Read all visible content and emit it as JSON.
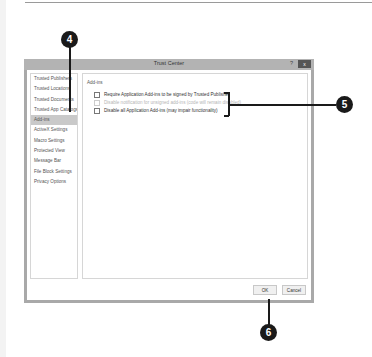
{
  "dialog": {
    "title": "Trust Center",
    "help_label": "?",
    "close_label": "x",
    "nav_items": [
      {
        "label": "Trusted Publishers",
        "selected": false
      },
      {
        "label": "Trusted Locations",
        "selected": false
      },
      {
        "label": "Trusted Documents",
        "selected": false
      },
      {
        "label": "Trusted App Catalogs",
        "selected": false
      },
      {
        "label": "Add-ins",
        "selected": true
      },
      {
        "label": "ActiveX Settings",
        "selected": false
      },
      {
        "label": "Macro Settings",
        "selected": false
      },
      {
        "label": "Protected View",
        "selected": false
      },
      {
        "label": "Message Bar",
        "selected": false
      },
      {
        "label": "File Block Settings",
        "selected": false
      },
      {
        "label": "Privacy Options",
        "selected": false
      }
    ],
    "pane": {
      "heading": "Add-ins",
      "options": [
        {
          "label": "Require Application Add-ins to be signed by Trusted Publisher",
          "checked": false,
          "disabled": false
        },
        {
          "label": "Disable notification for unsigned add-ins (code will remain disabled)",
          "checked": false,
          "disabled": true
        },
        {
          "label": "Disable all Application Add-ins (may impair functionality)",
          "checked": false,
          "disabled": false
        }
      ]
    },
    "buttons": {
      "ok": "OK",
      "cancel": "Cancel"
    }
  },
  "callouts": {
    "c4": "4",
    "c5": "5",
    "c6": "6"
  }
}
